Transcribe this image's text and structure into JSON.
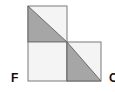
{
  "diagram": {
    "colors": {
      "stroke": "#7a7a7a",
      "fill_light": "#f4f4f4",
      "fill_shaded": "#a6a6a6"
    },
    "squares": [
      {
        "id": "top",
        "shaded_triangle": "lower-left",
        "diagonal": "top-left to bottom-right"
      },
      {
        "id": "bottom-left",
        "shaded_triangle": null
      },
      {
        "id": "bottom-right",
        "shaded_triangle": "lower-left",
        "diagonal": "top-left to bottom-right"
      }
    ],
    "labels": {
      "left": "F",
      "right": "C"
    }
  }
}
